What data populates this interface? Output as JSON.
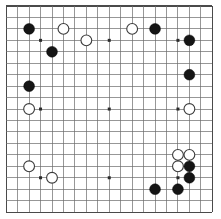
{
  "board": {
    "title": "Go board position",
    "size": 19,
    "origin_x": 6.2,
    "origin_y": 6.0,
    "spacing": 11.45,
    "line_color": "#6b6b6b",
    "edge_color": "#4a4a4a",
    "background_color": "#ffffff",
    "black_color": "#151515",
    "white_color": "#ffffff",
    "stone_radius": 5.4,
    "hoshi_radius": 1.5,
    "hoshi_points": [
      {
        "col": 3,
        "row": 3
      },
      {
        "col": 9,
        "row": 3
      },
      {
        "col": 15,
        "row": 3
      },
      {
        "col": 3,
        "row": 9
      },
      {
        "col": 9,
        "row": 9
      },
      {
        "col": 15,
        "row": 9
      },
      {
        "col": 3,
        "row": 15
      },
      {
        "col": 9,
        "row": 15
      },
      {
        "col": 15,
        "row": 15
      }
    ],
    "stones": [
      {
        "color": "black",
        "col": 2,
        "row": 2
      },
      {
        "color": "white",
        "col": 5,
        "row": 2
      },
      {
        "color": "white",
        "col": 7,
        "row": 3
      },
      {
        "color": "black",
        "col": 4,
        "row": 4
      },
      {
        "color": "white",
        "col": 11,
        "row": 2
      },
      {
        "color": "black",
        "col": 13,
        "row": 2
      },
      {
        "color": "black",
        "col": 16,
        "row": 3
      },
      {
        "color": "black",
        "col": 16,
        "row": 6
      },
      {
        "color": "black",
        "col": 2,
        "row": 7
      },
      {
        "color": "white",
        "col": 2,
        "row": 9
      },
      {
        "color": "white",
        "col": 16,
        "row": 9
      },
      {
        "color": "white",
        "col": 2,
        "row": 14
      },
      {
        "color": "white",
        "col": 4,
        "row": 15
      },
      {
        "color": "white",
        "col": 15,
        "row": 13
      },
      {
        "color": "white",
        "col": 16,
        "row": 13
      },
      {
        "color": "white",
        "col": 15,
        "row": 14
      },
      {
        "color": "black",
        "col": 16,
        "row": 14
      },
      {
        "color": "black",
        "col": 16,
        "row": 15
      },
      {
        "color": "black",
        "col": 15,
        "row": 16
      },
      {
        "color": "black",
        "col": 13,
        "row": 16
      }
    ]
  }
}
